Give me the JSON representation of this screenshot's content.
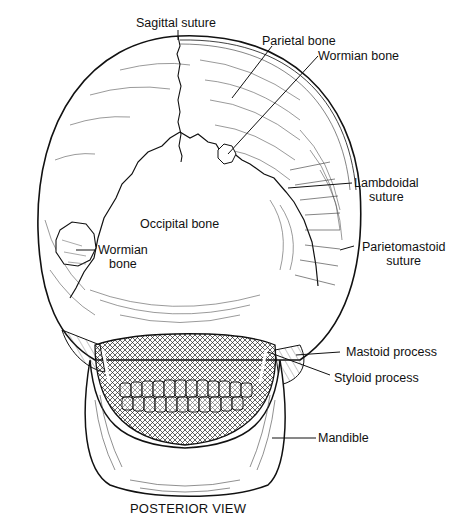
{
  "figure": {
    "caption": "POSTERIOR VIEW",
    "colors": {
      "ink": "#111111",
      "background": "#ffffff",
      "hatch": "#333333"
    }
  },
  "labels": {
    "sagittal_suture": "Sagittal suture",
    "parietal_bone": "Parietal bone",
    "wormian_bone_upper": "Wormian bone",
    "lambdoidal_suture_line1": "Lambdoidal",
    "lambdoidal_suture_line2": "suture",
    "parietomastoid_suture_line1": "Parietomastoid",
    "parietomastoid_suture_line2": "suture",
    "occipital_bone": "Occipital bone",
    "wormian_bone_left_line1": "Wormian",
    "wormian_bone_left_line2": "bone",
    "mastoid_process": "Mastoid process",
    "styloid_process": "Styloid process",
    "mandible": "Mandible"
  }
}
